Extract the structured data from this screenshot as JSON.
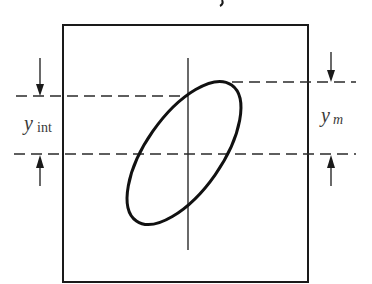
{
  "diagram": {
    "type": "lissajous-ellipse-measurement",
    "labels": {
      "left": {
        "main": "y",
        "sub": "int"
      },
      "right": {
        "main": "y",
        "sub": "m"
      }
    },
    "colors": {
      "stroke": "#1a1a1a",
      "dash": "#2a2a2a",
      "background": "#ffffff"
    },
    "elements": [
      "frame-box",
      "vertical-axis",
      "ellipse-trace",
      "intercept-top-dashed-line",
      "max-top-dashed-line",
      "center-dashed-line",
      "left-arrows",
      "right-arrows"
    ]
  }
}
